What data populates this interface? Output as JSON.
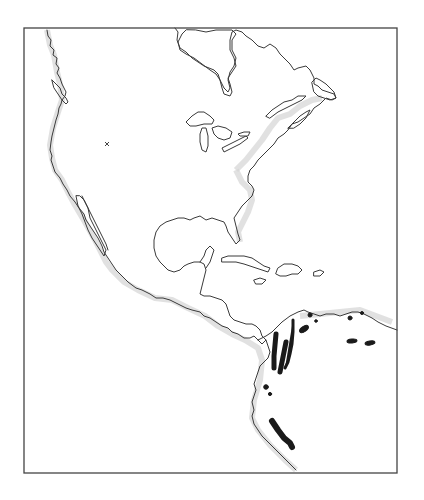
{
  "figure": {
    "type": "distribution-map",
    "region": "North America, Central America, Caribbean, northwestern South America",
    "frame": {
      "x": 24,
      "y": 28,
      "width": 373,
      "height": 445
    }
  },
  "markers": [
    {
      "id": "type-locality",
      "symbol": "x",
      "x": 107,
      "y": 144
    }
  ],
  "colors": {
    "background": "#ffffff",
    "coastline": "#3a3a3a",
    "coastal_stipple": "#d4d4d4",
    "range_fill": "#1a1a1a",
    "frame": "#444444"
  },
  "ranges": [
    {
      "id": "western-cordillera",
      "kind": "elongated",
      "x1": 276,
      "y1": 334,
      "x2": 274,
      "y2": 368,
      "width": 5
    },
    {
      "id": "central-cordillera",
      "kind": "elongated",
      "x1": 286,
      "y1": 342,
      "x2": 280,
      "y2": 372,
      "width": 5
    },
    {
      "id": "eastern-cordillera",
      "kind": "elongated",
      "x1": 293,
      "y1": 320,
      "x2": 285,
      "y2": 368,
      "width": 3
    },
    {
      "id": "santa-marta",
      "kind": "blob",
      "x": 304,
      "y": 329,
      "rx": 5,
      "ry": 2.6,
      "rotate": -35
    },
    {
      "id": "north-coast-dot-1",
      "kind": "dot",
      "x": 310,
      "y": 315,
      "r": 2
    },
    {
      "id": "north-coast-dot-2",
      "kind": "dot",
      "x": 316,
      "y": 321,
      "r": 1.3
    },
    {
      "id": "venezuela-coast-dot",
      "kind": "dot",
      "x": 350,
      "y": 318,
      "r": 2
    },
    {
      "id": "venezuela-coast-dot-2",
      "kind": "dot",
      "x": 362,
      "y": 313,
      "r": 1.5
    },
    {
      "id": "venezuela-interior-1",
      "kind": "blob",
      "x": 352,
      "y": 341,
      "rx": 5,
      "ry": 2,
      "rotate": -5
    },
    {
      "id": "venezuela-interior-2",
      "kind": "blob",
      "x": 370,
      "y": 343,
      "rx": 5,
      "ry": 2,
      "rotate": -10
    },
    {
      "id": "ecuador-dot-1",
      "kind": "dot",
      "x": 266,
      "y": 387,
      "r": 2.3
    },
    {
      "id": "ecuador-dot-2",
      "kind": "dot",
      "x": 270,
      "y": 394,
      "r": 1.6
    },
    {
      "id": "peru-andes",
      "kind": "elongated",
      "x1": 272,
      "y1": 421,
      "x2": 292,
      "y2": 447,
      "width": 6
    }
  ]
}
